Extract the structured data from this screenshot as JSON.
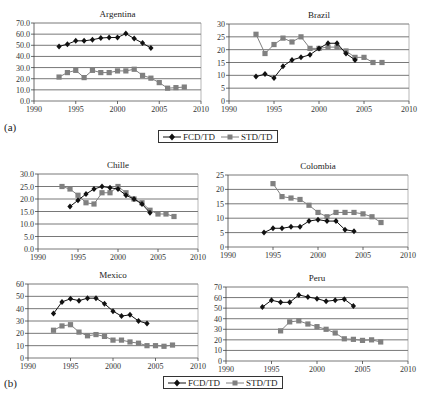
{
  "figure": {
    "panel_a_label": "(a)",
    "panel_b_label": "(b)",
    "legend": [
      {
        "name": "FCD/TD",
        "marker": "diamond",
        "color": "#111111"
      },
      {
        "name": "STD/TD",
        "marker": "square",
        "color": "#808080"
      }
    ]
  },
  "chart_data": [
    {
      "type": "line",
      "title": "Argentina",
      "xlim": [
        1990,
        2010
      ],
      "xticks": [
        1990,
        1995,
        2000,
        2005,
        2010
      ],
      "ylim": [
        0,
        70
      ],
      "yticks": [
        "0.0",
        "10.0",
        "20.0",
        "30.0",
        "40.0",
        "50.0",
        "60.0",
        "70.0"
      ],
      "grid": true,
      "series": [
        {
          "name": "FCD/TD",
          "x": [
            1993,
            1994,
            1995,
            1996,
            1997,
            1998,
            1999,
            2000,
            2001,
            2002,
            2003,
            2004
          ],
          "values": [
            49,
            51,
            54,
            54,
            55,
            56.5,
            57,
            57,
            60.5,
            56,
            52,
            47.5
          ]
        },
        {
          "name": "STD/TD",
          "x": [
            1993,
            1994,
            1995,
            1996,
            1997,
            1998,
            1999,
            2000,
            2001,
            2002,
            2003,
            2004,
            2005,
            2006,
            2007,
            2008
          ],
          "values": [
            21.5,
            25.5,
            27.5,
            21,
            27.5,
            25.5,
            25.5,
            27,
            27,
            28.5,
            23,
            20.5,
            16.5,
            11.5,
            12,
            12.5
          ]
        }
      ]
    },
    {
      "type": "line",
      "title": "Brazil",
      "xlim": [
        1990,
        2010
      ],
      "xticks": [
        1990,
        1995,
        2000,
        2005,
        2010
      ],
      "ylim": [
        0,
        30
      ],
      "yticks": [
        "0",
        "5",
        "10",
        "15",
        "20",
        "25",
        "30"
      ],
      "grid": true,
      "series": [
        {
          "name": "FCD/TD",
          "x": [
            1993,
            1994,
            1995,
            1996,
            1997,
            1998,
            1999,
            2000,
            2001,
            2002,
            2003,
            2004
          ],
          "values": [
            9.5,
            10.5,
            9,
            13.5,
            16,
            17,
            18,
            20.5,
            22.5,
            22.5,
            18.5,
            16
          ]
        },
        {
          "name": "STD/TD",
          "x": [
            1993,
            1994,
            1995,
            1996,
            1997,
            1998,
            1999,
            2000,
            2001,
            2002,
            2003,
            2004,
            2005,
            2006,
            2007
          ],
          "values": [
            26,
            18.5,
            22,
            24.5,
            23,
            25,
            20.5,
            20.5,
            21,
            21,
            19.5,
            17,
            17,
            15,
            15
          ]
        }
      ]
    },
    {
      "type": "line",
      "title": "Chille",
      "xlim": [
        1990,
        2010
      ],
      "xticks": [
        1990,
        1995,
        2000,
        2005,
        2010
      ],
      "ylim": [
        0,
        30
      ],
      "yticks": [
        "0.0",
        "5.0",
        "10.0",
        "15.0",
        "20.0",
        "25.0",
        "30.0"
      ],
      "grid": true,
      "series": [
        {
          "name": "FCD/TD",
          "x": [
            1994,
            1995,
            1996,
            1997,
            1998,
            1999,
            2000,
            2001,
            2002,
            2003,
            2004
          ],
          "values": [
            17,
            19.5,
            22,
            24,
            25,
            24.5,
            24,
            21.5,
            20,
            18,
            14.5
          ]
        },
        {
          "name": "STD/TD",
          "x": [
            1993,
            1994,
            1995,
            1996,
            1997,
            1998,
            1999,
            2000,
            2001,
            2002,
            2003,
            2004,
            2005,
            2006,
            2007
          ],
          "values": [
            25,
            24,
            21.5,
            18.5,
            18,
            22.5,
            22.5,
            25,
            22.5,
            20,
            18.5,
            15.5,
            14,
            14,
            13
          ]
        }
      ]
    },
    {
      "type": "line",
      "title": "Colombia",
      "xlim": [
        1990,
        2010
      ],
      "xticks": [
        1990,
        1995,
        2000,
        2005,
        2010
      ],
      "ylim": [
        0,
        25
      ],
      "yticks": [
        "0",
        "5",
        "10",
        "15",
        "20",
        "25"
      ],
      "grid": true,
      "series": [
        {
          "name": "FCD/TD",
          "x": [
            1994,
            1995,
            1996,
            1997,
            1998,
            1999,
            2000,
            2001,
            2002,
            2003,
            2004
          ],
          "values": [
            5,
            6.5,
            6.5,
            7,
            7,
            9,
            9.5,
            9,
            9,
            6,
            5.5
          ]
        },
        {
          "name": "STD/TD",
          "x": [
            1995,
            1996,
            1997,
            1998,
            1999,
            2000,
            2001,
            2002,
            2003,
            2004,
            2005,
            2006,
            2007
          ],
          "values": [
            22,
            17.5,
            17,
            16.5,
            14.5,
            12,
            10.5,
            12,
            12,
            12,
            11.5,
            10.5,
            8.5
          ]
        }
      ]
    },
    {
      "type": "line",
      "title": "Mexico",
      "xlim": [
        1990,
        2010
      ],
      "xticks": [
        1990,
        1995,
        2000,
        2005,
        2010
      ],
      "ylim": [
        0,
        60
      ],
      "yticks": [
        "0",
        "10",
        "20",
        "30",
        "40",
        "50",
        "60"
      ],
      "grid": true,
      "series": [
        {
          "name": "FCD/TD",
          "x": [
            1993,
            1994,
            1995,
            1996,
            1997,
            1998,
            1999,
            2000,
            2001,
            2002,
            2003,
            2004
          ],
          "values": [
            36,
            45.5,
            48,
            46.5,
            48.5,
            48.5,
            44,
            38,
            34,
            35,
            30,
            28
          ]
        },
        {
          "name": "STD/TD",
          "x": [
            1993,
            1994,
            1995,
            1996,
            1997,
            1998,
            1999,
            2000,
            2001,
            2002,
            2003,
            2004,
            2005,
            2006,
            2007
          ],
          "values": [
            22.5,
            26,
            27,
            21,
            18,
            19,
            17.5,
            14.5,
            14.5,
            13,
            12,
            10,
            10,
            9.5,
            10.5
          ]
        }
      ]
    },
    {
      "type": "line",
      "title": "Peru",
      "xlim": [
        1990,
        2010
      ],
      "xticks": [
        1990,
        1995,
        2000,
        2005,
        2010
      ],
      "ylim": [
        0,
        70
      ],
      "yticks": [
        "0",
        "10",
        "20",
        "30",
        "40",
        "50",
        "60",
        "70"
      ],
      "grid": true,
      "series": [
        {
          "name": "FCD/TD",
          "x": [
            1994,
            1995,
            1996,
            1997,
            1998,
            1999,
            2000,
            2001,
            2002,
            2003,
            2004
          ],
          "values": [
            51,
            57.5,
            55.5,
            55.5,
            62.5,
            60.5,
            59,
            56.5,
            57.5,
            58.5,
            52
          ]
        },
        {
          "name": "STD/TD",
          "x": [
            1996,
            1997,
            1998,
            1999,
            2000,
            2001,
            2002,
            2003,
            2004,
            2005,
            2006,
            2007
          ],
          "values": [
            28.5,
            37,
            38,
            35,
            32.5,
            30,
            26.5,
            21,
            20.5,
            19.5,
            20,
            18
          ]
        }
      ]
    }
  ]
}
